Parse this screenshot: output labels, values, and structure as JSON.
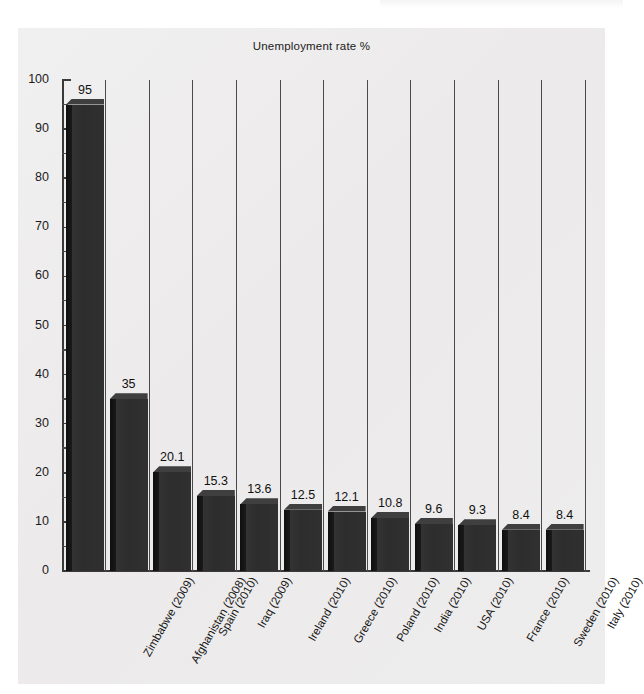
{
  "chart_data": {
    "type": "bar",
    "title": "Unemployment rate %",
    "xlabel": "",
    "ylabel": "",
    "ylim": [
      0,
      100
    ],
    "ytick_step": 10,
    "yminor_step": 5,
    "grid": false,
    "legend": "none",
    "orientation": "vertical",
    "style": "3d",
    "categories": [
      "Zimbabwe (2009)",
      "Afghanistan (2008)",
      "Spain (2010)",
      "Iraq (2009)",
      "Ireland (2010)",
      "Greece (2010)",
      "Poland (2010)",
      "India (2010)",
      "USA (2010)",
      "France (2010)",
      "Sweden (2010)",
      "Italy (2010)"
    ],
    "values": [
      95,
      35,
      20.1,
      15.3,
      13.6,
      12.5,
      12.1,
      10.8,
      9.6,
      9.3,
      8.4,
      8.4
    ],
    "value_labels": [
      "95",
      "35",
      "20.1",
      "15.3",
      "13.6",
      "12.5",
      "12.1",
      "10.8",
      "9.6",
      "9.3",
      "8.4",
      "8.4"
    ],
    "ytick_labels": [
      "0",
      "10",
      "20",
      "30",
      "40",
      "50",
      "60",
      "70",
      "80",
      "90",
      "100"
    ],
    "colors": {
      "bar_front": "#2f2f2f",
      "bar_side": "#141414",
      "bar_top": "#3f3f3f",
      "panel_background": "#edecec",
      "page_background": "#ffffff",
      "axis": "#3a3a3a",
      "text": "#111111",
      "column_separator": "#4a4a4a"
    }
  }
}
